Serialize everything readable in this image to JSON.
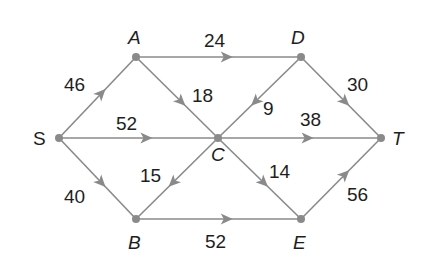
{
  "diagram": {
    "type": "directed weighted network",
    "colors": {
      "edge": "#8a8a8a",
      "node": "#8a8a8a",
      "text": "#1e1e1e",
      "background": "#ffffff"
    },
    "nodes": [
      {
        "id": "S",
        "label": "S",
        "x": 59,
        "y": 138,
        "lx": 33,
        "ly": 145,
        "italic": false
      },
      {
        "id": "A",
        "label": "A",
        "x": 136,
        "y": 57,
        "lx": 128,
        "ly": 44,
        "italic": true
      },
      {
        "id": "D",
        "label": "D",
        "x": 301,
        "y": 57,
        "lx": 291,
        "ly": 44,
        "italic": true
      },
      {
        "id": "C",
        "label": "C",
        "x": 218,
        "y": 138,
        "lx": 211,
        "ly": 161,
        "italic": true
      },
      {
        "id": "T",
        "label": "T",
        "x": 381,
        "y": 138,
        "lx": 392,
        "ly": 145,
        "italic": true
      },
      {
        "id": "B",
        "label": "B",
        "x": 136,
        "y": 219,
        "lx": 128,
        "ly": 249,
        "italic": true
      },
      {
        "id": "E",
        "label": "E",
        "x": 301,
        "y": 219,
        "lx": 293,
        "ly": 249,
        "italic": true
      }
    ],
    "edges": [
      {
        "from": "S",
        "to": "A",
        "weight": "46",
        "lx": 64,
        "ly": 91
      },
      {
        "from": "S",
        "to": "C",
        "weight": "52",
        "lx": 116,
        "ly": 130
      },
      {
        "from": "S",
        "to": "B",
        "weight": "40",
        "lx": 64,
        "ly": 203
      },
      {
        "from": "A",
        "to": "D",
        "weight": "24",
        "lx": 204,
        "ly": 47
      },
      {
        "from": "A",
        "to": "C",
        "weight": "18",
        "lx": 192,
        "ly": 102
      },
      {
        "from": "D",
        "to": "C",
        "weight": "9",
        "lx": 263,
        "ly": 115
      },
      {
        "from": "D",
        "to": "T",
        "weight": "30",
        "lx": 347,
        "ly": 91
      },
      {
        "from": "C",
        "to": "T",
        "weight": "38",
        "lx": 300,
        "ly": 126
      },
      {
        "from": "C",
        "to": "B",
        "weight": "15",
        "lx": 140,
        "ly": 182
      },
      {
        "from": "C",
        "to": "E",
        "weight": "14",
        "lx": 269,
        "ly": 178
      },
      {
        "from": "B",
        "to": "E",
        "weight": "52",
        "lx": 205,
        "ly": 248
      },
      {
        "from": "E",
        "to": "T",
        "weight": "56",
        "lx": 347,
        "ly": 201
      }
    ]
  }
}
